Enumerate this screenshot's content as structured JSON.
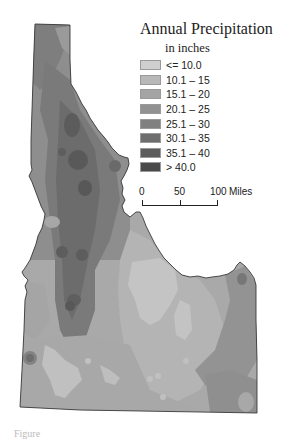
{
  "map": {
    "title": "Annual Precipitation",
    "subtitle": "in inches",
    "region": "Idaho",
    "legend": [
      {
        "label": "<= 10.0",
        "color": "#cfcfcf"
      },
      {
        "label": "10.1 – 15",
        "color": "#b8b8b8"
      },
      {
        "label": "15.1 – 20",
        "color": "#a4a4a4"
      },
      {
        "label": "20.1 – 25",
        "color": "#929292"
      },
      {
        "label": "25.1 – 30",
        "color": "#808080"
      },
      {
        "label": "30.1 – 35",
        "color": "#6e6e6e"
      },
      {
        "label": "35.1 – 40",
        "color": "#5c5c5c"
      },
      {
        "label": "> 40.0",
        "color": "#4a4a4a"
      }
    ],
    "scale_bar": {
      "ticks": [
        "0",
        "50",
        "100"
      ],
      "unit": "Miles"
    }
  },
  "caption": {
    "text": "Figure"
  }
}
